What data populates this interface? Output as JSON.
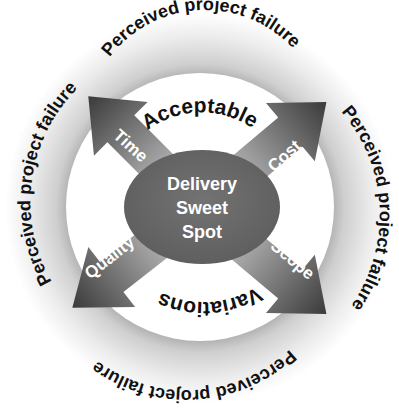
{
  "diagram": {
    "center": {
      "line1": "Delivery",
      "line2": "Sweet",
      "line3": "Spot"
    },
    "arrows": {
      "time": "Time",
      "cost": "Cost",
      "quality": "Quality",
      "scope": "Scope"
    },
    "inner_zones": {
      "top": "Acceptable",
      "bottom": "Variations"
    },
    "outer_ring": {
      "top": "Perceived project failure",
      "left": "Perceived  project  failure",
      "right": "Perceived project failure",
      "bottom": "Perceived project  failure"
    },
    "colors": {
      "ring_light": "#f4f4f4",
      "ring_dark": "#bdbdbd",
      "ellipse": "#6b6b6b",
      "arrow_dark": "#3c3c3c",
      "arrow_light": "#dadada",
      "text_dark": "#111111",
      "text_light": "#ffffff"
    }
  }
}
